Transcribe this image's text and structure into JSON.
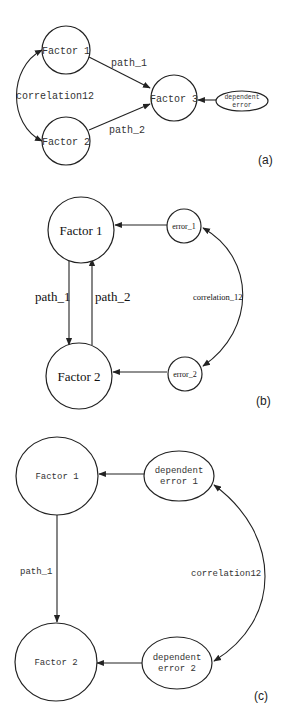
{
  "panels": [
    {
      "label": "(a)",
      "nodes": {
        "factor1": "Factor 1",
        "factor2": "Factor 2",
        "factor3": "Factor 3",
        "error_line1": "dependent",
        "error_line2": "error"
      },
      "edges": {
        "path_1": "path_1",
        "path_2": "path_2",
        "correlation": "correlation12"
      }
    },
    {
      "label": "(b)",
      "nodes": {
        "factor1": "Factor 1",
        "factor2": "Factor 2",
        "error1": "error_1",
        "error2": "error_2"
      },
      "edges": {
        "path_1": "path_1",
        "path_2": "path_2",
        "correlation": "correlation_12"
      }
    },
    {
      "label": "(c)",
      "nodes": {
        "factor1": "Factor 1",
        "factor2": "Factor 2",
        "error1_line1": "dependent",
        "error1_line2": "error 1",
        "error2_line1": "dependent",
        "error2_line2": "error 2"
      },
      "edges": {
        "path_1": "path_1",
        "correlation": "correlation12"
      }
    }
  ]
}
